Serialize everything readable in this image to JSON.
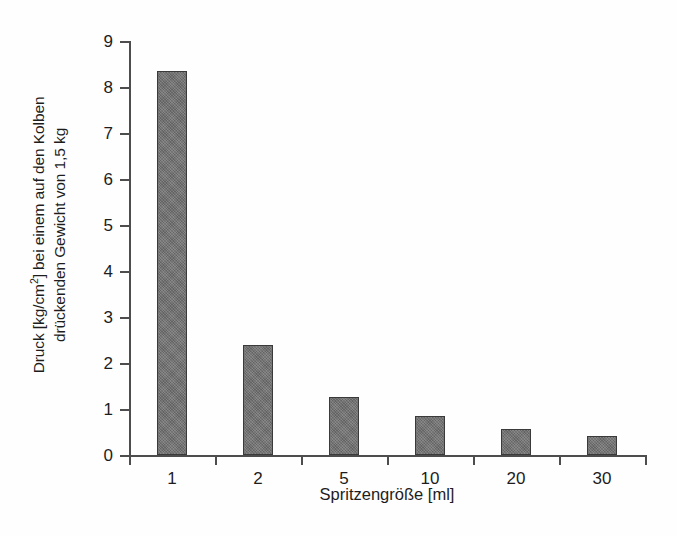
{
  "chart_data": {
    "type": "bar",
    "title": "",
    "categories": [
      "1",
      "2",
      "5",
      "10",
      "20",
      "30"
    ],
    "values": [
      8.35,
      2.4,
      1.27,
      0.85,
      0.57,
      0.42
    ],
    "series": [
      {
        "name": "Druck",
        "values": [
          8.35,
          2.4,
          1.27,
          0.85,
          0.57,
          0.42
        ]
      }
    ],
    "xlabel": "Spritzengröße [ml]",
    "ylabel_line1": "Druck [kg/cm2] bei einem auf den Kolben",
    "ylabel_line2": "drückenden Gewicht von 1,5 kg",
    "ylabel_prefix": "Druck [kg/cm",
    "ylabel_superscript": "2",
    "ylabel_suffix": "] bei einem auf den Kolben",
    "ylim": [
      0,
      9
    ],
    "yticks": [
      "0",
      "1",
      "2",
      "3",
      "4",
      "5",
      "6",
      "7",
      "8",
      "9"
    ],
    "grid": false,
    "legend": "none",
    "bar_color": "#6f6f6f",
    "bar_edge_color": "#3a3a3a",
    "axis_color": "#4d4d4d",
    "background_color": "#fefefe"
  }
}
